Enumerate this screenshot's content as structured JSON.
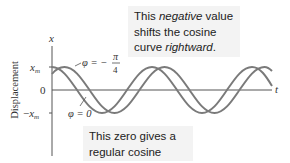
{
  "diagram": {
    "axes": {
      "y_axis_label": "x",
      "x_axis_label": "t",
      "ylabel_side": "Displacement",
      "y_ticks": [
        "x_m",
        "0",
        "−x_m"
      ]
    },
    "curves": [
      {
        "name": "phi-zero-curve",
        "label_text": "φ = 0",
        "phase": "0",
        "color": "#7a7a7a"
      },
      {
        "name": "phi-neg-pi-4-curve",
        "label_text": "φ = −",
        "label_frac_num": "π",
        "label_frac_den": "4",
        "phase": "-π/4",
        "color": "#7a7a7a"
      }
    ],
    "callouts": {
      "top": {
        "part1": "This ",
        "emph1": "negative",
        "part2": " value shifts the cosine curve ",
        "emph2": "rightward",
        "part3": "."
      },
      "bottom": {
        "text": "This zero gives a regular cosine curve."
      }
    },
    "colors": {
      "curve": "#7a7a7a",
      "axis": "#555555",
      "callout_bg": "#f3f3f3",
      "text": "#222222"
    }
  }
}
